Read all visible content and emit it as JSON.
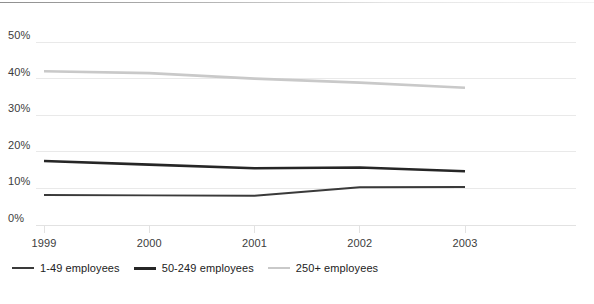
{
  "chart_data": {
    "type": "line",
    "title": "",
    "subtitle": "",
    "xlabel": "",
    "ylabel": "",
    "categories": [
      "1999",
      "2000",
      "2001",
      "2002",
      "2003"
    ],
    "x": [
      1999,
      2000,
      2001,
      2002,
      2003
    ],
    "ylim": [
      0,
      50
    ],
    "yticks": [
      0,
      10,
      20,
      30,
      40,
      50
    ],
    "ytick_labels": [
      "0%",
      "10%",
      "20%",
      "30%",
      "40%",
      "50%"
    ],
    "xtick_labels": [
      "1999",
      "2000",
      "2001",
      "2002",
      "2003"
    ],
    "grid": true,
    "grid_axis": "y",
    "legend_position": "bottom-left",
    "series": [
      {
        "name": "1-49 employees",
        "values": [
          8.2,
          8.1,
          8.0,
          10.3,
          10.4
        ],
        "color": "#3a3a3a",
        "width": 1.9
      },
      {
        "name": "50-249 employees",
        "values": [
          17.5,
          16.5,
          15.5,
          15.7,
          14.7
        ],
        "color": "#262626",
        "width": 2.6
      },
      {
        "name": "250+ employees",
        "values": [
          42.0,
          41.5,
          40.0,
          38.9,
          37.5
        ],
        "color": "#c9c9c9",
        "width": 2.6
      }
    ]
  },
  "axis": {
    "y_labels": [
      "50%",
      "40%",
      "30%",
      "20%",
      "10%",
      "0%"
    ],
    "x_labels": [
      "1999",
      "2000",
      "2001",
      "2002",
      "2003"
    ]
  },
  "legend": {
    "items": [
      {
        "label": "1-49 employees",
        "color": "#3a3a3a",
        "thickness": "2px"
      },
      {
        "label": "50-249 employees",
        "color": "#262626",
        "thickness": "3px"
      },
      {
        "label": "250+ employees",
        "color": "#c9c9c9",
        "thickness": "2px"
      }
    ]
  },
  "colors": {
    "background": "#ffffff",
    "gridline": "#e9e9e9",
    "axis_line": "#e2e2e2",
    "tick_text": "#3c3c3c",
    "legend_text": "#222222",
    "top_rule": "#8f8f8f"
  }
}
